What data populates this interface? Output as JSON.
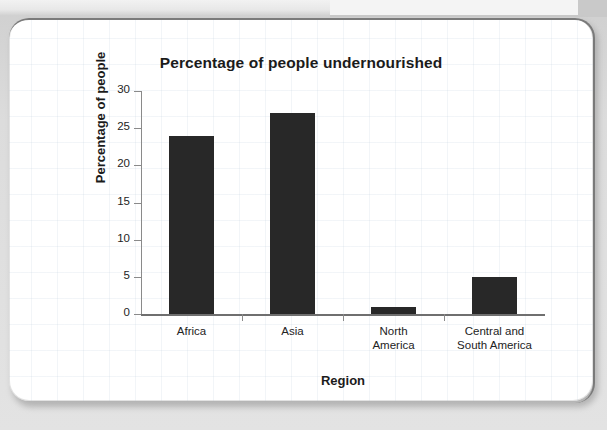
{
  "chart_data": {
    "type": "bar",
    "title": "Percentage of people undernourished",
    "xlabel": "Region",
    "ylabel": "Percentage of people",
    "categories": [
      "Africa",
      "Asia",
      "North America",
      "Central and South America"
    ],
    "category_lines": [
      [
        "Africa"
      ],
      [
        "Asia"
      ],
      [
        "North",
        "America"
      ],
      [
        "Central and",
        "South America"
      ]
    ],
    "values": [
      24,
      27,
      1,
      5
    ],
    "ylim": [
      0,
      30
    ],
    "ytick_labels": [
      "0",
      "5",
      "10",
      "15",
      "20",
      "25",
      "30"
    ],
    "yticks": [
      0,
      5,
      10,
      15,
      20,
      25,
      30
    ],
    "grid": false,
    "legend": "none",
    "bar_color": "#282828",
    "axis_color": "#8a8a8a",
    "text_color": "#232323"
  },
  "page": {
    "card_background": "#ffffff",
    "backdrop_color": "#d8d8d8",
    "grid_paper_color": "#b2c4d6"
  }
}
